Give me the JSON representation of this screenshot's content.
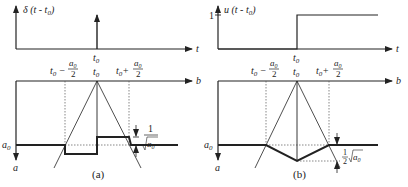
{
  "panel_a": {
    "caption": "(a)",
    "top_ylabel": "δ (t - t",
    "top_ylabel_sub": "0",
    "top_xlabel": "t",
    "t0": "t",
    "t0_sub": "0",
    "bottom_xlabel": "b",
    "bottom_ylabel": "a",
    "a0": "a",
    "a0_sub": "0",
    "left_tick": "t",
    "left_tick_op": "−",
    "right_tick_op": "+",
    "frac_num": "a",
    "frac_den": "2",
    "delta_num": "1",
    "delta_den": "a",
    "delta_den_sub": "0"
  },
  "panel_b": {
    "caption": "(b)",
    "top_ylabel": "u (t - t",
    "top_ylabel_sub": "0",
    "top_y_tick": "1",
    "top_xlabel": "t",
    "bottom_xlabel": "b",
    "bottom_ylabel": "a",
    "delta_coef_num": "1",
    "delta_coef_den": "2",
    "delta_root": "a",
    "delta_root_sub": "0"
  },
  "colors": {
    "line": "#222222",
    "dotted": "#555555",
    "background": "#ffffff"
  }
}
